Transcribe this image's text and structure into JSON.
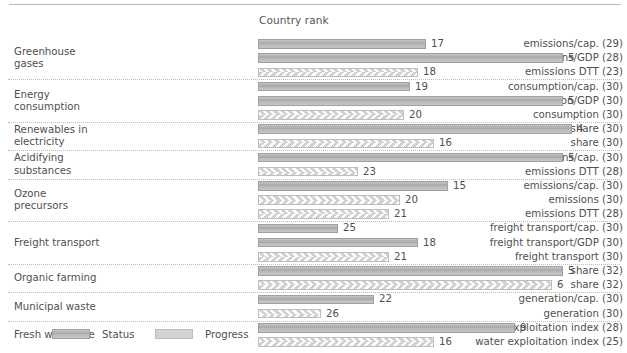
{
  "chart_data": {
    "type": "bar",
    "title": "Country rank",
    "xlabel": "",
    "ylabel": "",
    "orientation": "horizontal",
    "note": "Bar length is inversely proportional to the country rank value (rank 1 = longest). Each indicator row is either a Status bar (solid grey) or a Progress bar (chevron hatched).",
    "series_types": [
      "Status",
      "Progress"
    ],
    "legend": [
      {
        "key": "status",
        "label": "Status"
      },
      {
        "key": "progress",
        "label": "Progress"
      }
    ],
    "colors": {
      "status_fill": "#b0b0b0",
      "status_border": "#a0a0a0",
      "progress_fill": "#d2d2d2",
      "progress_border": "#bdbdbd",
      "progress_chevron": "#ffffff",
      "separator": "#c9b9a8",
      "text": "#4f4f4f",
      "top_rule": "#b8b8b8"
    },
    "groups": [
      {
        "name": "Greenhouse\ngases",
        "rows": [
          {
            "indicator": "emissions/cap. (29)",
            "type": "status",
            "rank": 17,
            "value_label": "17",
            "bar_px": 168
          },
          {
            "indicator": "emissions/GDP (28)",
            "type": "status",
            "rank": 5,
            "value_label": "5",
            "bar_px": 305
          },
          {
            "indicator": "emissions DTT (23)",
            "type": "progress",
            "rank": 18,
            "value_label": "18",
            "bar_px": 160
          }
        ]
      },
      {
        "name": "Energy\nconsumption",
        "rows": [
          {
            "indicator": "consumption/cap. (30)",
            "type": "status",
            "rank": 19,
            "value_label": "19",
            "bar_px": 152
          },
          {
            "indicator": "consumption/GDP (30)",
            "type": "status",
            "rank": 5,
            "value_label": "5",
            "bar_px": 305
          },
          {
            "indicator": "consumption (30)",
            "type": "progress",
            "rank": 20,
            "value_label": "20",
            "bar_px": 146
          }
        ]
      },
      {
        "name": "Renewables in\nelectricity",
        "rows": [
          {
            "indicator": "share (30)",
            "type": "status",
            "rank": 4,
            "value_label": "4",
            "bar_px": 314
          },
          {
            "indicator": "share (30)",
            "type": "progress",
            "rank": 16,
            "value_label": "16",
            "bar_px": 176
          }
        ]
      },
      {
        "name": "Acidifying\nsubstances",
        "rows": [
          {
            "indicator": "emissions/cap. (30)",
            "type": "status",
            "rank": 5,
            "value_label": "5",
            "bar_px": 305
          },
          {
            "indicator": "emissions DTT (28)",
            "type": "progress",
            "rank": 23,
            "value_label": "23",
            "bar_px": 100
          }
        ]
      },
      {
        "name": "Ozone\nprecursors",
        "rows": [
          {
            "indicator": "emissions/cap. (30)",
            "type": "status",
            "rank": 15,
            "value_label": "15",
            "bar_px": 190
          },
          {
            "indicator": "emissions (30)",
            "type": "progress",
            "rank": 20,
            "value_label": "20",
            "bar_px": 142
          },
          {
            "indicator": "emissions DTT (28)",
            "type": "progress",
            "rank": 21,
            "value_label": "21",
            "bar_px": 131
          }
        ]
      },
      {
        "name": "Freight transport",
        "rows": [
          {
            "indicator": "freight transport/cap. (30)",
            "type": "status",
            "rank": 25,
            "value_label": "25",
            "bar_px": 80
          },
          {
            "indicator": "freight transport/GDP (30)",
            "type": "status",
            "rank": 18,
            "value_label": "18",
            "bar_px": 160
          },
          {
            "indicator": "freight transport (30)",
            "type": "progress",
            "rank": 21,
            "value_label": "21",
            "bar_px": 131
          }
        ]
      },
      {
        "name": "Organic farming",
        "rows": [
          {
            "indicator": "share (32)",
            "type": "status",
            "rank": 5,
            "value_label": "5",
            "bar_px": 305
          },
          {
            "indicator": "share (32)",
            "type": "progress",
            "rank": 6,
            "value_label": "6",
            "bar_px": 294
          }
        ]
      },
      {
        "name": "Municipal waste",
        "rows": [
          {
            "indicator": "generation/cap. (30)",
            "type": "status",
            "rank": 22,
            "value_label": "22",
            "bar_px": 116
          },
          {
            "indicator": "generation (30)",
            "type": "progress",
            "rank": 26,
            "value_label": "26",
            "bar_px": 63
          }
        ]
      },
      {
        "name": "Fresh water use",
        "rows": [
          {
            "indicator": "water exploitation index (28)",
            "type": "status",
            "rank": 9,
            "value_label": "9",
            "bar_px": 257
          },
          {
            "indicator": "water exploitation index (25)",
            "type": "progress",
            "rank": 16,
            "value_label": "16",
            "bar_px": 176
          }
        ]
      }
    ]
  }
}
